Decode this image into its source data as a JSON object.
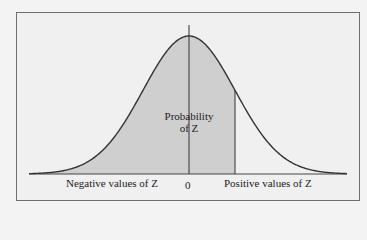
{
  "chart_data": {
    "type": "area",
    "title": "",
    "distribution": "normal",
    "mean": 0,
    "shaded_region": {
      "from": "-infinity",
      "to": "positive Z"
    },
    "annotation": {
      "line1": "Probability",
      "line2": "of Z"
    },
    "x_labels": {
      "left": "Negative values of Z",
      "center": "0",
      "right": "Positive values of Z"
    },
    "xlabel": "",
    "ylabel": "",
    "grid": false,
    "colors": {
      "shade": "#cfcfcf",
      "curve": "#333333",
      "background": "#f0f0f0",
      "frame": "#6f6f6f"
    }
  }
}
